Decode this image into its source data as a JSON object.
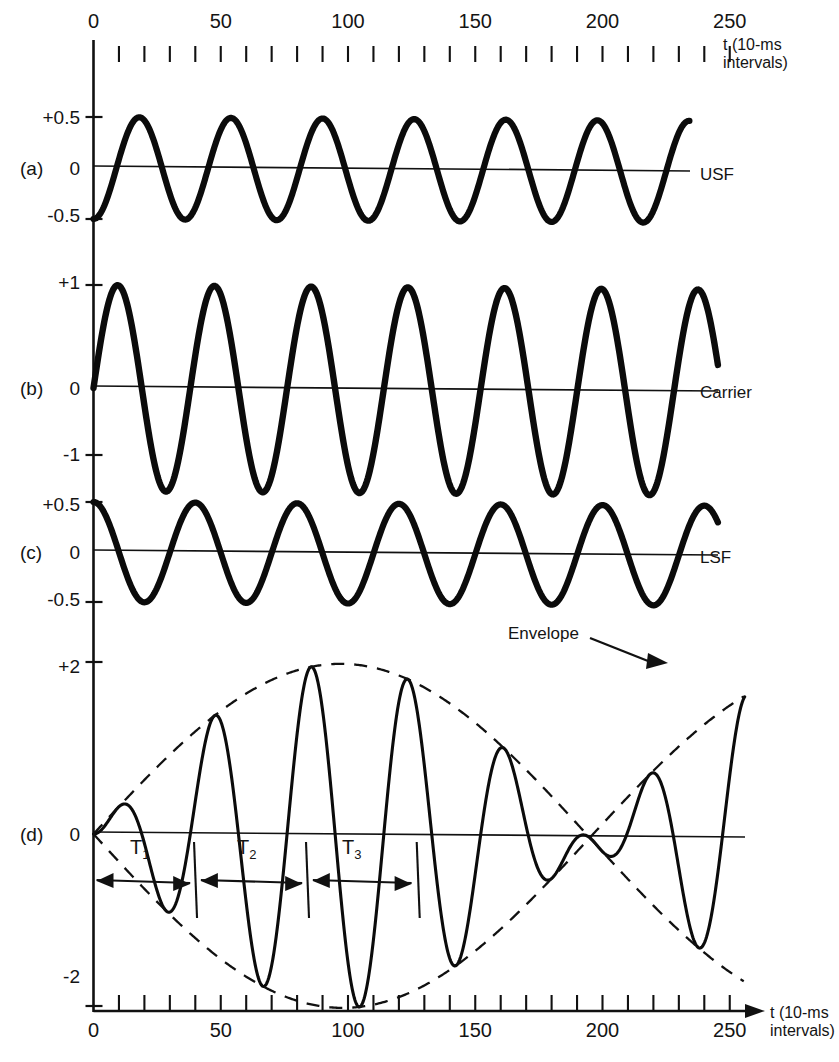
{
  "figure": {
    "kind": "amplitude-modulation-waveforms",
    "top_axis": {
      "caption_line1": "t (10-ms",
      "caption_line2": "intervals)",
      "tick_labels": [
        "0",
        "50",
        "100",
        "150",
        "200",
        "250"
      ],
      "tick_values": [
        0,
        50,
        100,
        150,
        200,
        250
      ],
      "minor_tick_step": 10
    },
    "bottom_axis": {
      "caption_line1": "t (10-ms",
      "caption_line2": "intervals)",
      "tick_labels": [
        "0",
        "50",
        "100",
        "150",
        "200",
        "250"
      ],
      "tick_values": [
        0,
        50,
        100,
        150,
        200,
        250
      ],
      "minor_tick_step": 10,
      "has_arrow": true
    },
    "panels": [
      {
        "id": "(a)",
        "name": "USF",
        "y_labels": [
          "+0.5",
          "0",
          "-0.5"
        ],
        "y_values": [
          0.5,
          0,
          -0.5
        ]
      },
      {
        "id": "(b)",
        "name": "Carrier",
        "y_labels": [
          "+1",
          "0",
          "-1"
        ],
        "y_values": [
          1,
          0,
          -1
        ]
      },
      {
        "id": "(c)",
        "name": "LSF",
        "y_labels": [
          "+0.5",
          "0",
          "-0.5"
        ],
        "y_values": [
          0.5,
          0,
          -0.5
        ]
      },
      {
        "id": "(d)",
        "name": "",
        "y_labels": [
          "+2",
          "0",
          "-2"
        ],
        "y_values": [
          2,
          0,
          -2
        ],
        "annotations": {
          "envelope_label": "Envelope",
          "period_labels": [
            "T",
            "T",
            "T"
          ],
          "period_subscripts": [
            "1",
            "2",
            "3"
          ]
        }
      }
    ]
  },
  "chart_data": {
    "type": "line",
    "title": "",
    "xlabel": "t (10-ms intervals)",
    "ylabel": "",
    "xlim": [
      0,
      260
    ],
    "grid": false,
    "legend": "right-of-axis inline labels",
    "panels": [
      {
        "id": "(a)",
        "label": "USF",
        "ylim": [
          -0.6,
          0.6
        ],
        "yticks": [
          0.5,
          0,
          -0.5
        ],
        "ytick_labels": [
          "+0.5",
          "0",
          "-0.5"
        ],
        "waveform": {
          "form": "-0.5*cos(2*pi*t/36)",
          "amplitude": 0.5,
          "period_t": 36,
          "cycles_visible": 7,
          "phase": "starts at minimum (-0.5) at t=0",
          "linewidth": "thick",
          "style": "solid"
        }
      },
      {
        "id": "(b)",
        "label": "Carrier",
        "ylim": [
          -1.15,
          1.15
        ],
        "yticks": [
          1,
          0,
          -1
        ],
        "ytick_labels": [
          "+1",
          "0",
          "-1"
        ],
        "waveform": {
          "form": "1.0*sin(2*pi*t/38)",
          "amplitude": 1.0,
          "period_t": 38,
          "cycles_visible": 6.5,
          "phase": "starts at zero rising at t=0",
          "linewidth": "thick",
          "style": "solid"
        }
      },
      {
        "id": "(c)",
        "label": "LSF",
        "ylim": [
          -0.6,
          0.6
        ],
        "yticks": [
          0.5,
          0,
          -0.5
        ],
        "ytick_labels": [
          "+0.5",
          "0",
          "-0.5"
        ],
        "waveform": {
          "form": "+0.5*cos(2*pi*t/40)",
          "amplitude": 0.5,
          "period_t": 40,
          "cycles_visible": 6,
          "phase": "starts at maximum (+0.5) at t=0",
          "linewidth": "thick",
          "style": "solid"
        }
      },
      {
        "id": "(d)",
        "label": "",
        "ylim": [
          -2.25,
          2.25
        ],
        "yticks": [
          2,
          0,
          -2
        ],
        "ytick_labels": [
          "+2",
          "0",
          "-2"
        ],
        "waveform": {
          "form": "sum of USF + Carrier + LSF (AM beat)",
          "peak_amplitude": 2.0,
          "beat_null_at_t": 150,
          "envelope_max_at_t": [
            55,
            250
          ],
          "envelope_style": "dashed",
          "carrier_style": "solid thin",
          "linewidth": "medium"
        },
        "annotations": [
          {
            "name": "Envelope",
            "kind": "leader-arrow-label",
            "points_to_t": 230
          },
          {
            "name": "T1",
            "kind": "period-span",
            "from_t": 0,
            "to_t": 38
          },
          {
            "name": "T2",
            "kind": "period-span",
            "from_t": 41,
            "to_t": 82
          },
          {
            "name": "T3",
            "kind": "period-span",
            "from_t": 85,
            "to_t": 125
          }
        ]
      }
    ]
  }
}
